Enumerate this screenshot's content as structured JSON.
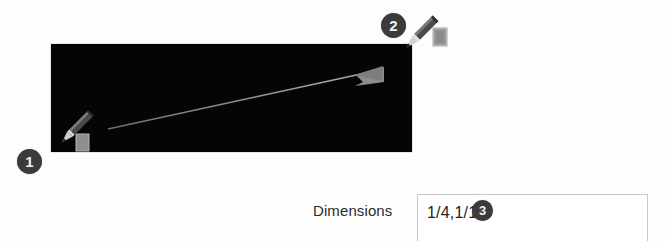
{
  "figure": {
    "background_color": "#fdfdfd"
  },
  "canvas": {
    "name": "drawing-canvas",
    "fill_color": "#050505",
    "arrow": {
      "label": "drag-direction-arrow",
      "color": "#8a8a8a",
      "start": {
        "x": 57,
        "y": 84
      },
      "end": {
        "x": 330,
        "y": 27
      }
    }
  },
  "callouts": [
    {
      "id": "1",
      "label": "1",
      "color": "#3b3b3b",
      "describes": "start-corner"
    },
    {
      "id": "2",
      "label": "2",
      "color": "#3b3b3b",
      "describes": "end-corner"
    },
    {
      "id": "3",
      "label": "3",
      "color": "#3b3b3b",
      "describes": "dimensions-value"
    }
  ],
  "cursors": [
    {
      "name": "pencil-cursor-start",
      "icon": "pencil-icon"
    },
    {
      "name": "pencil-cursor-end",
      "icon": "pencil-icon"
    }
  ],
  "dimensions_field": {
    "label": "Dimensions",
    "value": "1/4,1/16",
    "placeholder": "",
    "border_color": "#c9c9c9"
  }
}
